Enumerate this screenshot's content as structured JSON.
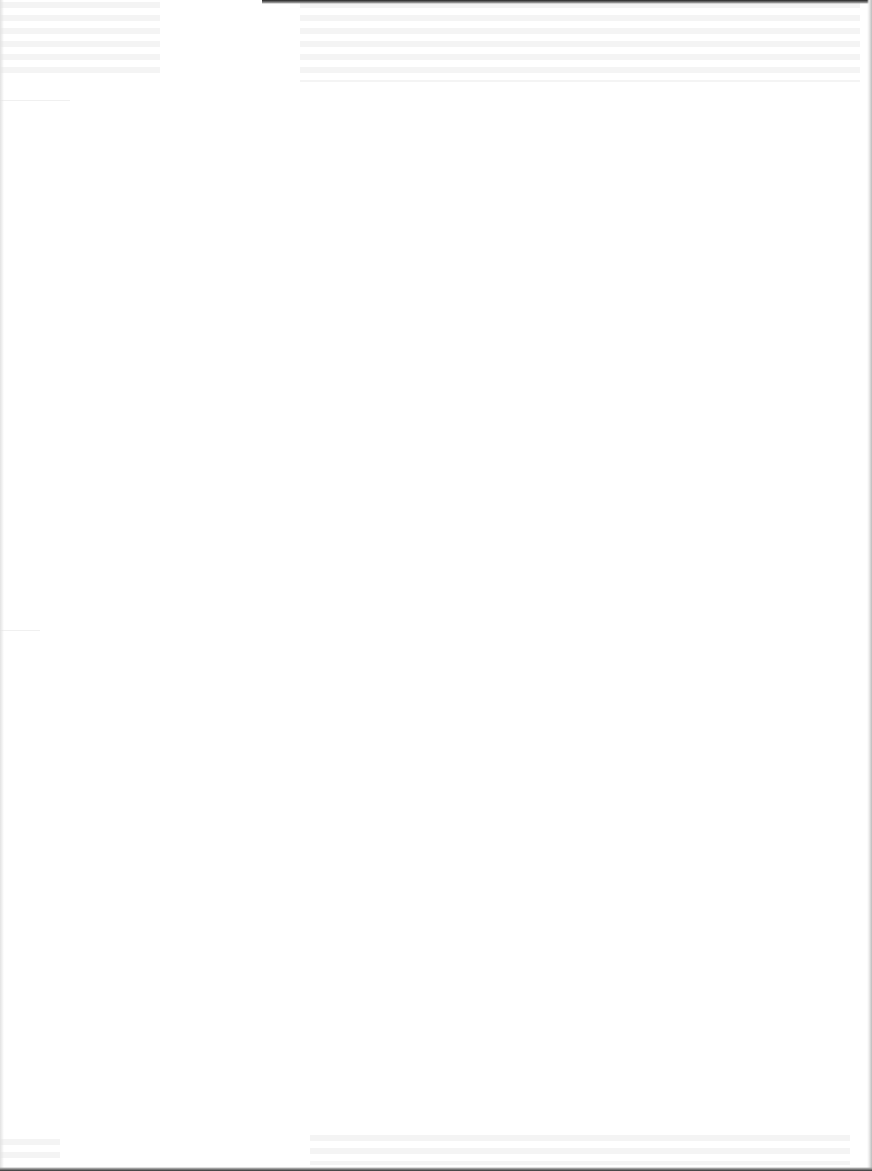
{
  "document": {
    "type": "scanned-page",
    "content": "",
    "state": "blank",
    "colors": {
      "paper": "#ffffff",
      "scan_edge": "#222222"
    }
  }
}
